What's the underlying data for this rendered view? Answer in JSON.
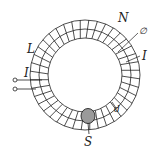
{
  "diagram": {
    "type": "toroidal-coil",
    "colors": {
      "line": "#222222",
      "background": "#ffffff",
      "cross_section_fill": "#9a9a9a"
    },
    "ring": {
      "center": [
        85,
        75
      ],
      "outer_radius": 55,
      "middle_radius": 46,
      "inner_radius": 37,
      "turn_count": 40
    },
    "labels": {
      "N": "N",
      "diameter_symbol": "∅",
      "L": "L",
      "I_left": "I",
      "I_right": "I",
      "d": "d",
      "S": "S"
    },
    "terminals": {
      "count": 2
    }
  }
}
